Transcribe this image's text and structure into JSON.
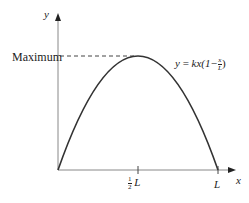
{
  "diagram": {
    "y_axis_label": "y",
    "x_axis_label": "x",
    "maximum_label": "Maximum",
    "equation": {
      "lhs": "y",
      "eq": "=",
      "rhs_prefix": "kx(1−",
      "frac_num": "x",
      "frac_den": "L",
      "rhs_suffix": ")"
    },
    "ticks": [
      {
        "label_frac_num": "1",
        "label_frac_den": "2",
        "label_var": "L"
      },
      {
        "label_var": "L"
      }
    ],
    "colors": {
      "axis": "#888888",
      "curve": "#333333",
      "text": "#222222"
    }
  }
}
